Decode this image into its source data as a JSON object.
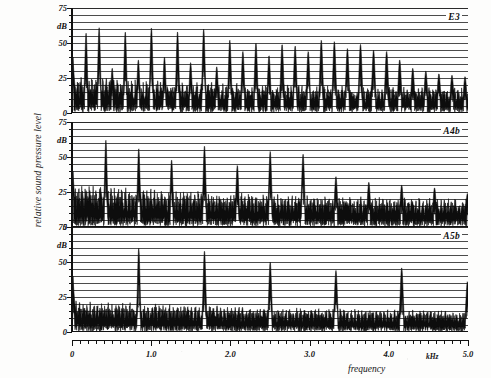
{
  "figure": {
    "axis_y_title": "relative sound pressure level",
    "axis_x_title": "frequency",
    "axis_x_unit": "kHz",
    "db_label": "dB"
  },
  "chart_data": {
    "type": "line",
    "title": "",
    "xlabel": "frequency",
    "ylabel": "relative sound pressure level",
    "x_unit": "kHz",
    "y_unit": "dB",
    "xlim": [
      0,
      5.0
    ],
    "ylim": [
      0,
      75
    ],
    "grid": true,
    "grid_spacing_db": 5,
    "xtick_labels": [
      "0",
      "1.0",
      "2.0",
      "3.0",
      "4.0",
      "5.0"
    ],
    "xticks": [
      0,
      1.0,
      2.0,
      3.0,
      4.0,
      5.0
    ],
    "xtick_minor_step": 0.1,
    "ytick_labels": [
      "0",
      "25",
      "50",
      "75"
    ],
    "yticks": [
      0,
      25,
      50,
      75
    ],
    "ytick_minor_step": 5,
    "legend_position": "inside-top-right",
    "panels": [
      {
        "label": "E3",
        "fundamental_khz": 0.165,
        "noise_floor_db": 14,
        "harmonics_khz": [
          0.165,
          0.33,
          0.495,
          0.66,
          0.825,
          0.99,
          1.155,
          1.32,
          1.485,
          1.65,
          1.815,
          1.98,
          2.145,
          2.31,
          2.475,
          2.64,
          2.805,
          2.97,
          3.135,
          3.3,
          3.465,
          3.63,
          3.795,
          3.96,
          4.125,
          4.29,
          4.455,
          4.62,
          4.785,
          4.95
        ],
        "harmonic_peaks_db": [
          57,
          61,
          32,
          58,
          38,
          61,
          40,
          58,
          36,
          60,
          33,
          52,
          44,
          50,
          41,
          49,
          48,
          44,
          52,
          51,
          46,
          49,
          45,
          44,
          38,
          32,
          30,
          28,
          27,
          26
        ]
      },
      {
        "label": "A4b",
        "fundamental_khz": 0.415,
        "noise_floor_db": 16,
        "harmonics_khz": [
          0.415,
          0.83,
          1.245,
          1.66,
          2.075,
          2.49,
          2.905,
          3.32,
          3.735,
          4.15,
          4.565,
          4.98
        ],
        "harmonic_peaks_db": [
          62,
          56,
          48,
          58,
          44,
          54,
          52,
          36,
          32,
          30,
          28,
          24
        ]
      },
      {
        "label": "A5b",
        "fundamental_khz": 0.83,
        "noise_floor_db": 12,
        "harmonics_khz": [
          0.83,
          1.66,
          2.49,
          3.32,
          4.15,
          4.98
        ],
        "harmonic_peaks_db": [
          60,
          58,
          50,
          44,
          46,
          36
        ]
      }
    ]
  }
}
